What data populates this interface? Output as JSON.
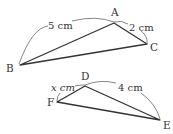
{
  "figure": {
    "triangle_abc": {
      "vertices": {
        "A": "A",
        "B": "B",
        "C": "C"
      },
      "side_labels": {
        "BA": "5 cm",
        "AC": "2 cm"
      }
    },
    "triangle_def": {
      "vertices": {
        "D": "D",
        "E": "E",
        "F": "F"
      },
      "side_labels": {
        "FD": "x cm",
        "DE": "4 cm"
      }
    },
    "colors": {
      "line": "#333333",
      "arc": "#555555",
      "background": "#ffffff"
    }
  }
}
